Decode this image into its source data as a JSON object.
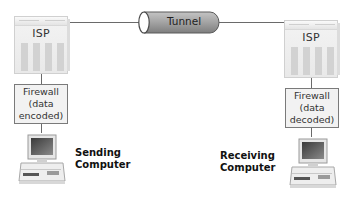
{
  "diagram": {
    "tunnel": {
      "label": "Tunnel"
    },
    "left": {
      "isp_label": "ISP",
      "firewall": {
        "line1": "Firewall",
        "line2": "(data",
        "line3": "encoded)"
      },
      "computer": {
        "line1": "Sending",
        "line2": "Computer"
      }
    },
    "right": {
      "isp_label": "ISP",
      "firewall": {
        "line1": "Firewall",
        "line2": "(data",
        "line3": "decoded)"
      },
      "computer": {
        "line1": "Receiving",
        "line2": "Computer"
      }
    }
  },
  "colors": {
    "line": "#6a6a6a",
    "tunnel_body": "#9a9a9a",
    "server": "#ececec",
    "firewall_border": "#7a7a7a"
  }
}
